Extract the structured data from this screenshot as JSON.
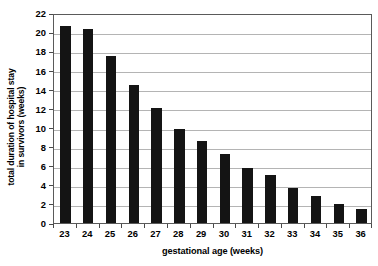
{
  "chart_data": {
    "type": "bar",
    "title": "",
    "subtitle": "",
    "xlabel": "gestational age (weeks)",
    "ylabel": "total duration of hospital stay in survivors (weeks)",
    "ylabel_line1": "total duration of hospital stay",
    "ylabel_line2": "in survivors (weeks)",
    "categories": [
      "23",
      "24",
      "25",
      "26",
      "27",
      "28",
      "29",
      "30",
      "31",
      "32",
      "33",
      "34",
      "35",
      "36"
    ],
    "values": [
      20.6,
      20.3,
      17.5,
      14.5,
      12.0,
      9.8,
      8.6,
      7.2,
      5.8,
      5.0,
      3.65,
      2.8,
      2.0,
      1.5
    ],
    "ylim": [
      0,
      22
    ],
    "xlim_categories": 14,
    "ytick_labels": [
      "0",
      "2",
      "4",
      "6",
      "8",
      "10",
      "12",
      "14",
      "16",
      "18",
      "20",
      "22"
    ],
    "ytick_values": [
      0,
      2,
      4,
      6,
      8,
      10,
      12,
      14,
      16,
      18,
      20,
      22
    ],
    "ytick_step": 2,
    "grid": true,
    "grid_orientation": "horizontal",
    "legend": false,
    "legend_position": "none",
    "bar_color": "#141414",
    "grid_color": "#b4b4b4",
    "axis_color": "#5a5a5a",
    "background_color": "#ffffff",
    "series": [
      {
        "name": "total duration of hospital stay in survivors",
        "values": [
          20.6,
          20.3,
          17.5,
          14.5,
          12.0,
          9.8,
          8.6,
          7.2,
          5.8,
          5.0,
          3.65,
          2.8,
          2.0,
          1.5
        ]
      }
    ]
  }
}
